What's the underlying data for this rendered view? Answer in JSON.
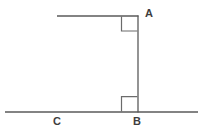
{
  "figure": {
    "background_color": "#ffffff",
    "line_color": "#5a5a5a",
    "angle_mark_color": "#6b6b6b",
    "label_color": "#3d3d3d",
    "width": 216,
    "height": 139,
    "points": {
      "A": {
        "label": "A",
        "x": 138,
        "y": 16
      },
      "B": {
        "label": "B",
        "x": 138,
        "y": 112
      },
      "C": {
        "label": "C",
        "x": 56,
        "y": 112
      }
    },
    "segments": [
      {
        "name": "top-horizontal-ray",
        "x1": 57,
        "y1": 16,
        "x2": 138,
        "y2": 16
      },
      {
        "name": "vertical-segment-AB",
        "x1": 138,
        "y1": 16,
        "x2": 138,
        "y2": 112
      },
      {
        "name": "bottom-horizontal-line",
        "x1": 5,
        "y1": 112,
        "x2": 198,
        "y2": 112
      }
    ],
    "right_angle_marks": [
      {
        "name": "right-angle-at-A",
        "vertex": "A",
        "size": 16
      },
      {
        "name": "right-angle-at-B",
        "vertex": "B",
        "size": 16
      }
    ]
  }
}
